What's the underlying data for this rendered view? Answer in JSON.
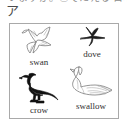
{
  "page": {
    "top_cutoff_text": "いますか。②でたえる 日本",
    "section_marker": "ア"
  },
  "figure": {
    "items": [
      {
        "label": "swan",
        "icon": "flying-white-bird-icon",
        "style": "white outline bird in flight, wings raised",
        "color": "#6e6e6e"
      },
      {
        "label": "dove",
        "icon": "flying-dark-bird-silhouette-icon",
        "style": "small dark swift silhouette in flight",
        "color": "#1c1c1c"
      },
      {
        "label": "crow",
        "icon": "black-crow-icon",
        "style": "solid black perching crow facing left",
        "color": "#111111"
      },
      {
        "label": "swallow",
        "icon": "white-swan-icon",
        "style": "white outline swan swimming, curved neck facing left",
        "color": "#6e6e6e"
      }
    ]
  },
  "colors": {
    "border": "#a9a9a9",
    "text": "#2f2f2f",
    "background": "#ffffff"
  }
}
